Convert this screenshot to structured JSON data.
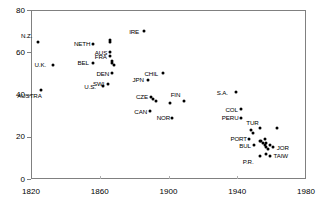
{
  "chart_data": {
    "type": "scatter",
    "title": "",
    "subtitle": "",
    "xlabel": "",
    "ylabel": "",
    "xlim": [
      1820,
      1980
    ],
    "ylim": [
      0,
      80
    ],
    "xticks": [
      1820,
      1860,
      1900,
      1940,
      1980
    ],
    "yticks": [
      0,
      20,
      40,
      60,
      80
    ],
    "grid": false,
    "legend": null,
    "marker": "filled-diamond",
    "marker_color": "#000000",
    "points": [
      {
        "label": "N.Z.",
        "x": 1824,
        "y": 65,
        "label_pos": "above-left"
      },
      {
        "label": "U.K.",
        "x": 1833,
        "y": 54,
        "label_pos": "left"
      },
      {
        "label": "AUSTRA",
        "x": 1826,
        "y": 42,
        "label_pos": "below-left"
      },
      {
        "label": "NETH",
        "x": 1856,
        "y": 64,
        "label_pos": "left"
      },
      {
        "label": "BEL",
        "x": 1856,
        "y": 55,
        "label_pos": "left"
      },
      {
        "label": "U.S.",
        "x": 1862,
        "y": 44,
        "label_pos": "left"
      },
      {
        "label": "SWI",
        "x": 1865,
        "y": 45,
        "label_pos": "left"
      },
      {
        "label": "",
        "x": 1866,
        "y": 66,
        "label_pos": "none"
      },
      {
        "label": "",
        "x": 1866,
        "y": 65,
        "label_pos": "none"
      },
      {
        "label": "AUS",
        "x": 1866,
        "y": 60,
        "label_pos": "left"
      },
      {
        "label": "FRA",
        "x": 1866,
        "y": 58,
        "label_pos": "left"
      },
      {
        "label": "",
        "x": 1867,
        "y": 56,
        "label_pos": "none"
      },
      {
        "label": "",
        "x": 1867,
        "y": 55,
        "label_pos": "none"
      },
      {
        "label": "",
        "x": 1868,
        "y": 54,
        "label_pos": "none"
      },
      {
        "label": "DEN",
        "x": 1867,
        "y": 50,
        "label_pos": "left"
      },
      {
        "label": "IRE",
        "x": 1886,
        "y": 70,
        "label_pos": "left"
      },
      {
        "label": "JPN",
        "x": 1888,
        "y": 47,
        "label_pos": "left"
      },
      {
        "label": "CZE",
        "x": 1890,
        "y": 39,
        "label_pos": "left"
      },
      {
        "label": "",
        "x": 1891,
        "y": 38,
        "label_pos": "none"
      },
      {
        "label": "",
        "x": 1893,
        "y": 37,
        "label_pos": "none"
      },
      {
        "label": "CAN",
        "x": 1889,
        "y": 32,
        "label_pos": "left"
      },
      {
        "label": "CHIL",
        "x": 1897,
        "y": 50,
        "label_pos": "left"
      },
      {
        "label": "",
        "x": 1901,
        "y": 36,
        "label_pos": "none"
      },
      {
        "label": "NOR",
        "x": 1902,
        "y": 29,
        "label_pos": "left"
      },
      {
        "label": "FIN",
        "x": 1909,
        "y": 37,
        "label_pos": "above-left"
      },
      {
        "label": "S.A.",
        "x": 1939,
        "y": 41,
        "label_pos": "left"
      },
      {
        "label": "COL",
        "x": 1942,
        "y": 33,
        "label_pos": "left"
      },
      {
        "label": "PERU",
        "x": 1942,
        "y": 29,
        "label_pos": "left"
      },
      {
        "label": "",
        "x": 1948,
        "y": 23,
        "label_pos": "none"
      },
      {
        "label": "TUR",
        "x": 1953,
        "y": 24,
        "label_pos": "above-left"
      },
      {
        "label": "",
        "x": 1949,
        "y": 22,
        "label_pos": "none"
      },
      {
        "label": "",
        "x": 1963,
        "y": 24,
        "label_pos": "none"
      },
      {
        "label": "PORT",
        "x": 1947,
        "y": 19,
        "label_pos": "left"
      },
      {
        "label": "BUL",
        "x": 1950,
        "y": 16,
        "label_pos": "left"
      },
      {
        "label": "",
        "x": 1953,
        "y": 18,
        "label_pos": "none"
      },
      {
        "label": "",
        "x": 1954,
        "y": 18,
        "label_pos": "none"
      },
      {
        "label": "",
        "x": 1955,
        "y": 17,
        "label_pos": "none"
      },
      {
        "label": "",
        "x": 1956,
        "y": 19,
        "label_pos": "none"
      },
      {
        "label": "",
        "x": 1956,
        "y": 16,
        "label_pos": "none"
      },
      {
        "label": "",
        "x": 1957,
        "y": 17,
        "label_pos": "none"
      },
      {
        "label": "",
        "x": 1957,
        "y": 15,
        "label_pos": "none"
      },
      {
        "label": "",
        "x": 1958,
        "y": 14,
        "label_pos": "none"
      },
      {
        "label": "",
        "x": 1959,
        "y": 16,
        "label_pos": "none"
      },
      {
        "label": "JOR",
        "x": 1961,
        "y": 15,
        "label_pos": "right"
      },
      {
        "label": "P.R.",
        "x": 1953,
        "y": 11,
        "label_pos": "below-left"
      },
      {
        "label": "",
        "x": 1957,
        "y": 12,
        "label_pos": "none"
      },
      {
        "label": "TAIW",
        "x": 1959,
        "y": 11,
        "label_pos": "right"
      }
    ]
  }
}
